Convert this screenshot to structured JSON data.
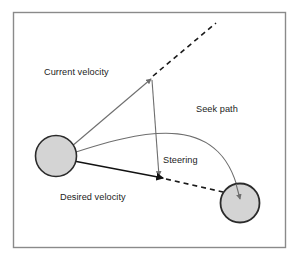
{
  "figure": {
    "name": "seek-steering-behavior-diagram",
    "type": "vector-diagram",
    "background_color": "#ffffff",
    "frame": {
      "name": "outer-frame",
      "x": 13,
      "y": 12,
      "width": 273,
      "height": 236,
      "stroke_color": "#8a8a8a",
      "fill_color": "#ffffff"
    }
  },
  "labels": {
    "current_velocity": "Current velocity",
    "seek_path": "Seek path",
    "steering": "Steering",
    "desired_velocity": "Desired velocity"
  },
  "colors": {
    "circle_fill": "#d4d4d4",
    "circle_stroke": "#2b2b2b",
    "gray_vector": "#6e6e6e",
    "black_vector": "#111111",
    "dashed_line": "#1a1a1a",
    "frame_stroke": "#8a8a8a",
    "text": "#1c1c1c"
  },
  "shapes": {
    "agent_circle": {
      "name": "agent-circle",
      "cx": 56,
      "cy": 156,
      "r": 20.5
    },
    "target_circle": {
      "name": "target-circle",
      "cx": 240,
      "cy": 203,
      "r": 19.5
    },
    "origin": {
      "x": 58,
      "y": 158
    }
  },
  "vectors": [
    {
      "name": "current-velocity-vector",
      "from": {
        "x": 58,
        "y": 158
      },
      "to": {
        "x": 151,
        "y": 79
      },
      "color": "#6e6e6e",
      "width": 1.1,
      "arrowhead": "gray"
    },
    {
      "name": "desired-velocity-vector",
      "from": {
        "x": 58,
        "y": 158
      },
      "to": {
        "x": 163,
        "y": 178
      },
      "color": "#111111",
      "width": 1.6,
      "arrowhead": "black"
    },
    {
      "name": "steering-vector",
      "from": {
        "x": 152,
        "y": 80
      },
      "to": {
        "x": 159,
        "y": 176
      },
      "color": "#6e6e6e",
      "width": 1.1,
      "arrowhead": "gray"
    },
    {
      "name": "seek-path-curve",
      "from": {
        "x": 58,
        "y": 158
      },
      "to": {
        "x": 240,
        "y": 203
      },
      "control1": {
        "x": 150,
        "y": 126
      },
      "control2": {
        "x": 224,
        "y": 112
      },
      "color": "#6e6e6e",
      "width": 1.1,
      "arrowhead": "gray"
    }
  ],
  "dashed_lines": [
    {
      "name": "current-velocity-extension-dashed",
      "from": {
        "x": 152,
        "y": 77
      },
      "to": {
        "x": 216,
        "y": 23
      },
      "dash": "5 4",
      "width": 1.5
    },
    {
      "name": "desired-velocity-extension-dashed",
      "from": {
        "x": 164,
        "y": 178
      },
      "to": {
        "x": 222,
        "y": 192
      },
      "dash": "5 4",
      "width": 1.5
    }
  ],
  "label_positions": {
    "current_velocity": {
      "x": 44,
      "y": 75
    },
    "seek_path": {
      "x": 196,
      "y": 112
    },
    "steering": {
      "x": 163,
      "y": 163
    },
    "desired_velocity": {
      "x": 60,
      "y": 200
    }
  }
}
